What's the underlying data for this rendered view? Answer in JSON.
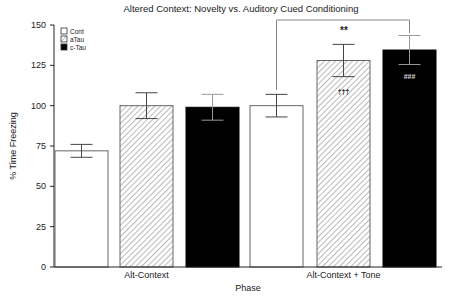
{
  "chart_data": {
    "type": "bar",
    "title": "Altered Context: Novelty vs. Auditory Cued Conditioning",
    "xlabel": "Phase",
    "ylabel": "% Time Freezing",
    "ylim": [
      0,
      150
    ],
    "yticks": [
      0,
      25,
      50,
      75,
      100,
      125,
      150
    ],
    "categories": [
      "Alt-Context",
      "Alt-Context + Tone"
    ],
    "series": [
      {
        "name": "Cont",
        "fill": "white",
        "values": [
          72,
          100
        ],
        "errors": [
          4,
          7
        ]
      },
      {
        "name": "aTau",
        "fill": "hatched",
        "values": [
          100,
          128
        ],
        "errors": [
          8,
          10
        ]
      },
      {
        "name": "c-Tau",
        "fill": "black",
        "values": [
          99,
          134.5
        ],
        "errors": [
          8,
          9
        ]
      }
    ],
    "annotations": [
      {
        "text": "**",
        "type": "bracket",
        "from": "Cont, Alt-Context + Tone",
        "to": "c-Tau, Alt-Context + Tone"
      },
      {
        "text": "†††",
        "on": "aTau, Alt-Context + Tone"
      },
      {
        "text": "###",
        "on": "c-Tau, Alt-Context + Tone"
      }
    ],
    "legend_position": "upper-left",
    "grid": false
  },
  "legend": {
    "items": [
      {
        "label": "Cont"
      },
      {
        "label": "aTau"
      },
      {
        "label": "c-Tau"
      }
    ]
  }
}
